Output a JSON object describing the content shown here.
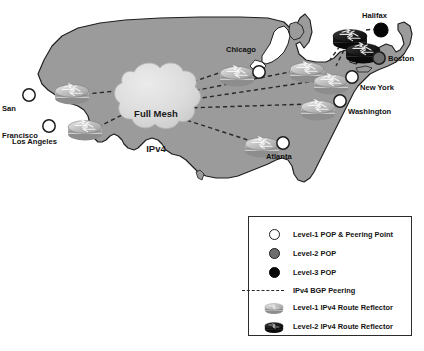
{
  "diagram": {
    "cloud": {
      "line1": "Full Mesh",
      "line2": "IPv4"
    },
    "cities": [
      {
        "name": "San Francisco",
        "label": "San\nFrancisco",
        "node_type": "level-1-pop",
        "x": 29,
        "y": 95,
        "label_x": 2,
        "label_y": 86
      },
      {
        "name": "Los Angeles",
        "label": "Los Angeles",
        "node_type": "level-1-pop",
        "x": 49,
        "y": 126,
        "label_x": 12,
        "label_y": 137
      },
      {
        "name": "Chicago",
        "label": "Chicago",
        "node_type": "level-1-pop",
        "x": 259,
        "y": 72,
        "label_x": 226,
        "label_y": 48
      },
      {
        "name": "New York",
        "label": "New York",
        "node_type": "level-1-pop",
        "x": 352,
        "y": 77,
        "label_x": 360,
        "label_y": 84
      },
      {
        "name": "Washington",
        "label": "Washington",
        "node_type": "level-1-pop",
        "x": 340,
        "y": 101,
        "label_x": 348,
        "label_y": 108
      },
      {
        "name": "Atlanta",
        "label": "Atlanta",
        "node_type": "level-1-pop",
        "x": 283,
        "y": 143,
        "label_x": 266,
        "label_y": 153
      },
      {
        "name": "Boston",
        "label": "Boston",
        "node_type": "level-2-pop",
        "x": 379,
        "y": 58,
        "label_x": 388,
        "label_y": 55
      },
      {
        "name": "Halifax",
        "label": "Halifax",
        "node_type": "level-3-pop",
        "x": 381,
        "y": 30,
        "label_x": 362,
        "label_y": 12
      }
    ],
    "routers": [
      {
        "site": "San Francisco",
        "kind": "level-1-route-reflector",
        "x": 72,
        "y": 92,
        "scale": 1.0
      },
      {
        "site": "Los Angeles",
        "kind": "level-1-route-reflector",
        "x": 85,
        "y": 128,
        "scale": 1.0
      },
      {
        "site": "Chicago",
        "kind": "level-1-route-reflector",
        "x": 237,
        "y": 74,
        "scale": 1.0
      },
      {
        "site": "New York",
        "kind": "level-1-route-reflector",
        "x": 330,
        "y": 80,
        "scale": 1.0
      },
      {
        "site": "North East",
        "kind": "level-1-route-reflector",
        "x": 307,
        "y": 72,
        "scale": 1.0
      },
      {
        "site": "Washington",
        "kind": "level-1-route-reflector",
        "x": 318,
        "y": 106,
        "scale": 1.0
      },
      {
        "site": "Atlanta",
        "kind": "level-1-route-reflector",
        "x": 262,
        "y": 145,
        "scale": 1.0
      },
      {
        "site": "Halifax Upper",
        "kind": "level-2-route-reflector",
        "x": 351,
        "y": 36,
        "scale": 1.0
      },
      {
        "site": "Halifax Lower",
        "kind": "level-2-route-reflector",
        "x": 363,
        "y": 50,
        "scale": 1.0
      }
    ],
    "peering_links": [
      {
        "from": "cloud",
        "to": "San Francisco"
      },
      {
        "from": "cloud",
        "to": "Los Angeles"
      },
      {
        "from": "cloud",
        "to": "Chicago"
      },
      {
        "from": "cloud",
        "to": "New York"
      },
      {
        "from": "cloud",
        "to": "Washington"
      },
      {
        "from": "cloud",
        "to": "Atlanta"
      },
      {
        "from": "Halifax Upper",
        "to": "Halifax"
      },
      {
        "from": "Halifax Lower",
        "to": "New York"
      }
    ]
  },
  "legend": {
    "items": [
      {
        "swatch": "level-1-pop-dot",
        "label": "Level-1 POP & Peering Point"
      },
      {
        "swatch": "level-2-pop-dot",
        "label": "Level-2 POP"
      },
      {
        "swatch": "level-3-pop-dot",
        "label": "Level-3 POP"
      },
      {
        "swatch": "dashed-line",
        "label": "IPv4 BGP Peering"
      },
      {
        "swatch": "level-1-router-icon",
        "label": "Level-1 IPv4 Route Reflector"
      },
      {
        "swatch": "level-2-router-icon",
        "label": "Level-2 IPv4 Route Reflector"
      }
    ]
  },
  "colors": {
    "map_fill": "#9b9b9b",
    "map_stroke": "#1e1e1e",
    "cloud_fill": "#d9d9d9",
    "dash_color": "#2a2a2a",
    "level1_pop": "#ffffff",
    "level2_pop": "#6e6e6e",
    "level3_pop": "#060606",
    "legend_border": "#2b2b2b",
    "text": "#111111"
  }
}
